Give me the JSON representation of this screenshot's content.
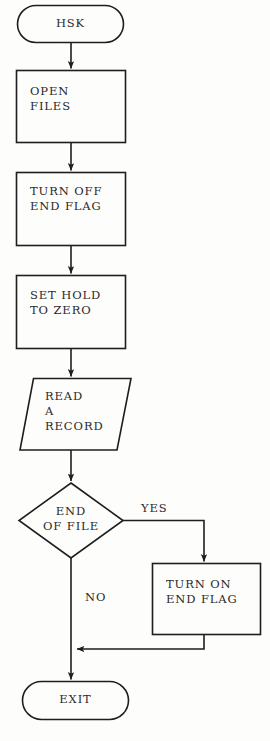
{
  "diagram": {
    "type": "flowchart",
    "stroke_color": "#1e1e1e",
    "background_color": "#fdfdfc",
    "text_color": "#2a2a2a",
    "nodes": [
      {
        "id": "start",
        "shape": "terminator",
        "label": "HSK",
        "lines": [
          "HSK"
        ]
      },
      {
        "id": "open_files",
        "shape": "process",
        "label": "OPEN FILES",
        "lines": [
          "OPEN",
          "FILES"
        ]
      },
      {
        "id": "turn_off_end_flag",
        "shape": "process",
        "label": "TURN OFF END FLAG",
        "lines": [
          "TURN OFF",
          "END FLAG"
        ]
      },
      {
        "id": "set_hold_to_zero",
        "shape": "process",
        "label": "SET HOLD TO ZERO",
        "lines": [
          "SET HOLD",
          "TO ZERO"
        ]
      },
      {
        "id": "read_a_record",
        "shape": "input-output",
        "label": "READ A RECORD",
        "lines": [
          "READ",
          "A",
          "RECORD"
        ]
      },
      {
        "id": "end_of_file",
        "shape": "decision",
        "label": "END OF FILE",
        "lines": [
          "END",
          "OF FILE"
        ]
      },
      {
        "id": "turn_on_end_flag",
        "shape": "process",
        "label": "TURN ON END FLAG",
        "lines": [
          "TURN ON",
          "END FLAG"
        ]
      },
      {
        "id": "exit",
        "shape": "terminator",
        "label": "EXIT",
        "lines": [
          "EXIT"
        ]
      }
    ],
    "edges": [
      {
        "id": "e1",
        "from": "start",
        "to": "open_files",
        "label": ""
      },
      {
        "id": "e2",
        "from": "open_files",
        "to": "turn_off_end_flag",
        "label": ""
      },
      {
        "id": "e3",
        "from": "turn_off_end_flag",
        "to": "set_hold_to_zero",
        "label": ""
      },
      {
        "id": "e4",
        "from": "set_hold_to_zero",
        "to": "read_a_record",
        "label": ""
      },
      {
        "id": "e5",
        "from": "read_a_record",
        "to": "end_of_file",
        "label": ""
      },
      {
        "id": "e6",
        "from": "end_of_file",
        "to": "turn_on_end_flag",
        "label": "YES"
      },
      {
        "id": "e7",
        "from": "end_of_file",
        "to": "exit",
        "label": "NO"
      },
      {
        "id": "e8",
        "from": "turn_on_end_flag",
        "to": "exit",
        "label": ""
      }
    ],
    "labels": {
      "yes": "YES",
      "no": "NO"
    }
  }
}
